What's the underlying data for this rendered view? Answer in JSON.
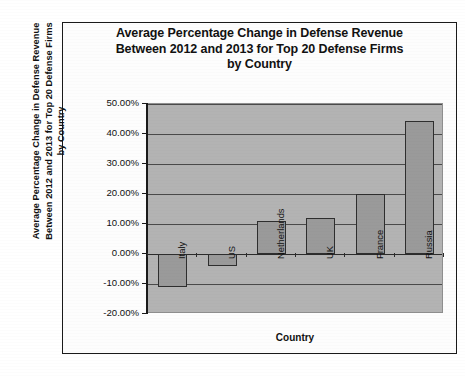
{
  "figure": {
    "title": "Average Percentage Change in Defense Revenue Between 2012 and 2013 for Top 20 Defense Firms by Country",
    "title_line1": "Average Percentage Change in Defense Revenue",
    "title_line2": "Between 2012 and 2013 for Top 20 Defense Firms",
    "title_line3": "by Country"
  },
  "chart_data": {
    "type": "bar",
    "title": "Average Percentage Change in Defense Revenue Between 2012 and 2013 for Top 20 Defense Firms by Country",
    "categories": [
      "Italy",
      "US",
      "Netherlands",
      "UK",
      "France",
      "Russia"
    ],
    "values": [
      -11.0,
      -4.0,
      11.0,
      12.0,
      20.0,
      44.5
    ],
    "value_labels": [
      "-11.00%",
      "-4.00%",
      "11.00%",
      "12.00%",
      "20.00%",
      "44.50%"
    ],
    "xlabel": "Country",
    "ylabel": "Average Percentage Change in Defense Revenue Between 2012 and 2013 for Top 20 Defense Firms by Country",
    "ylim": [
      -20,
      50
    ],
    "ytick_values": [
      50,
      40,
      30,
      20,
      10,
      0,
      -10,
      -20
    ],
    "ytick_labels": [
      "50.00%",
      "40.00%",
      "30.00%",
      "20.00%",
      "10.00%",
      "0.00%",
      "-10.00%",
      "-20.00%"
    ],
    "grid": true,
    "legend": "none",
    "colors": {
      "bar_fill": "#9a9a9a",
      "bar_border": "#2e2e2e",
      "plot_background": "#b3b3b3",
      "gridline": "#4a4a4a",
      "text": "#111111"
    }
  }
}
